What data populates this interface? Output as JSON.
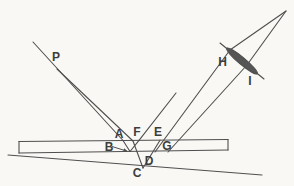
{
  "figure": {
    "background": "#f9f8f5",
    "ink_color": "#4f4f4f",
    "label_color": "#3d3d3d",
    "width": 294,
    "height": 186,
    "labels": [
      {
        "id": "P",
        "text": "P",
        "cx": 56,
        "cy": 57
      },
      {
        "id": "A",
        "text": "A",
        "cx": 119,
        "cy": 134
      },
      {
        "id": "F",
        "text": "F",
        "cx": 137,
        "cy": 131.5
      },
      {
        "id": "E",
        "text": "E",
        "cx": 158,
        "cy": 131.5
      },
      {
        "id": "B",
        "text": "B",
        "cx": 109,
        "cy": 146.5
      },
      {
        "id": "G",
        "text": "G",
        "cx": 167,
        "cy": 145.5
      },
      {
        "id": "D",
        "text": "D",
        "cx": 149,
        "cy": 160.5
      },
      {
        "id": "C",
        "text": "C",
        "cx": 137,
        "cy": 172.5
      },
      {
        "id": "H",
        "text": "H",
        "cx": 222.5,
        "cy": 61.5
      },
      {
        "id": "I",
        "text": "I",
        "cx": 250,
        "cy": 80.5
      }
    ],
    "segments": [
      {
        "name": "plate-top-surface",
        "x1": 19,
        "y1": 141.5,
        "x2": 228,
        "y2": 139.5
      },
      {
        "name": "plate-right-edge",
        "x1": 228,
        "y1": 139.5,
        "x2": 228,
        "y2": 150
      },
      {
        "name": "plate-bottom-surface",
        "x1": 228,
        "y1": 150,
        "x2": 19,
        "y2": 153
      },
      {
        "name": "plate-left-edge",
        "x1": 19,
        "y1": 153,
        "x2": 19,
        "y2": 141.5
      },
      {
        "name": "tilted-test-surface",
        "x1": 8,
        "y1": 155,
        "x2": 262,
        "y2": 175
      },
      {
        "name": "incident-ray-1-from-P",
        "x1": 33,
        "y1": 42,
        "x2": 123,
        "y2": 140.5
      },
      {
        "name": "incident-ray-2-from-P",
        "x1": 57,
        "y1": 69,
        "x2": 133,
        "y2": 141
      },
      {
        "name": "refracted-ray-A-to-B",
        "x1": 123,
        "y1": 140.5,
        "x2": 130,
        "y2": 151.5
      },
      {
        "name": "reflected-ray-B-to-F",
        "x1": 130,
        "y1": 151.5,
        "x2": 139,
        "y2": 140.3
      },
      {
        "name": "exit-ray-at-F",
        "x1": 139,
        "y1": 140.3,
        "x2": 176,
        "y2": 93
      },
      {
        "name": "ray-2-through-plate-to-C",
        "x1": 133,
        "y1": 141,
        "x2": 143,
        "y2": 168
      },
      {
        "name": "reflected-ray-C-D-E",
        "x1": 143,
        "y1": 168,
        "x2": 160,
        "y2": 140.2
      },
      {
        "name": "ray-E-to-lens",
        "x1": 155,
        "y1": 152,
        "x2": 230,
        "y2": 50
      },
      {
        "name": "ray-G-to-lens",
        "x1": 168,
        "y1": 152,
        "x2": 247,
        "y2": 65
      },
      {
        "name": "lens-axis-line",
        "x1": 220,
        "y1": 43,
        "x2": 264,
        "y2": 79
      },
      {
        "name": "converging-ray-from-H",
        "x1": 230,
        "y1": 50,
        "x2": 286,
        "y2": 11
      },
      {
        "name": "converging-ray-from-I",
        "x1": 247,
        "y1": 65,
        "x2": 286,
        "y2": 11
      }
    ],
    "pointer_arrow": {
      "name": "B-pointer-arrow",
      "x1": 112,
      "y1": 146.5,
      "x2": 126.5,
      "y2": 151
    },
    "lens": {
      "cx": 242,
      "cy": 61,
      "rx": 20,
      "ry": 3.5,
      "angle_deg": 40
    }
  }
}
